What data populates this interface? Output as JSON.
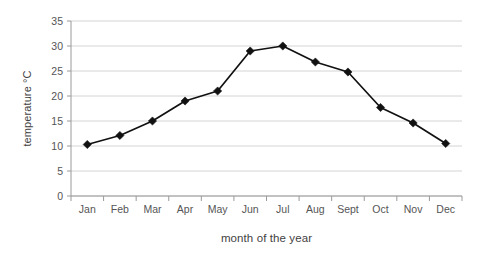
{
  "chart_data": {
    "type": "line",
    "title": "",
    "xlabel": "month of the year",
    "ylabel": "temperature °C",
    "categories": [
      "Jan",
      "Feb",
      "Mar",
      "Apr",
      "May",
      "Jun",
      "Jul",
      "Aug",
      "Sept",
      "Oct",
      "Nov",
      "Dec"
    ],
    "values": [
      10.3,
      12.1,
      15.0,
      19.0,
      21.0,
      29.0,
      30.0,
      26.8,
      24.8,
      17.7,
      14.6,
      10.5
    ],
    "series": [
      {
        "name": "temperature",
        "values": [
          10.3,
          12.1,
          15.0,
          19.0,
          21.0,
          29.0,
          30.0,
          26.8,
          24.8,
          17.7,
          14.6,
          10.5
        ]
      }
    ],
    "ylim": [
      0,
      35
    ],
    "yticks": [
      0,
      5,
      10,
      15,
      20,
      25,
      30,
      35
    ],
    "ytick_labels": [
      "0",
      "5",
      "10",
      "15",
      "20",
      "25",
      "30",
      "35"
    ],
    "grid": true,
    "grid_axis": "y",
    "legend": false,
    "legend_position": "none",
    "marker": "diamond",
    "line_color": "#111111",
    "marker_color": "#111111",
    "grid_color": "#c9c9c9",
    "axis_color": "#9a9a9a",
    "background_color": "#ffffff"
  }
}
